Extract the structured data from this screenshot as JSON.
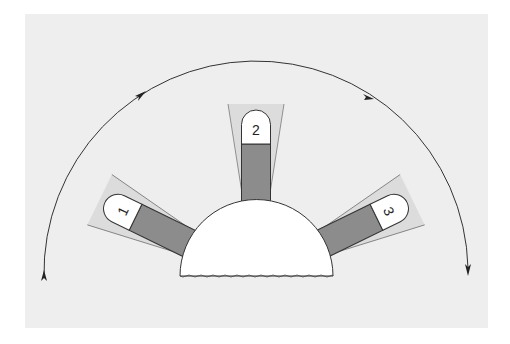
{
  "diagram": {
    "type": "rotation-sequence",
    "colors": {
      "panel": "#eeeeee",
      "bar_fill": "#8c8c8c",
      "cone_fill": "#dcdcdc",
      "tab_fill": "#ffffff",
      "stroke": "#333333"
    },
    "positions": [
      {
        "id": "1",
        "label": "1"
      },
      {
        "id": "2",
        "label": "2"
      },
      {
        "id": "3",
        "label": "3"
      }
    ],
    "arrow_path": {
      "direction": "clockwise",
      "arrowheads": 4
    }
  }
}
